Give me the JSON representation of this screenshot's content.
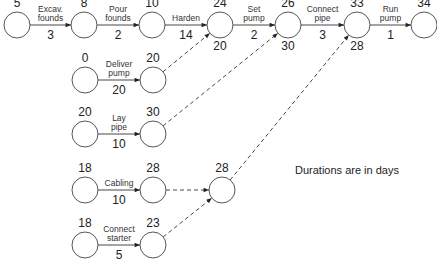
{
  "note": "Durations are in days",
  "nodes": [
    {
      "id": "n1",
      "x": 17,
      "y": 25,
      "top": "5",
      "bottom": ""
    },
    {
      "id": "n2",
      "x": 84,
      "y": 25,
      "top": "8",
      "bottom": ""
    },
    {
      "id": "n3",
      "x": 152,
      "y": 25,
      "top": "10",
      "bottom": ""
    },
    {
      "id": "n4",
      "x": 220,
      "y": 25,
      "top": "24",
      "bottom": "20"
    },
    {
      "id": "n5",
      "x": 288,
      "y": 25,
      "top": "26",
      "bottom": "30"
    },
    {
      "id": "n6",
      "x": 357,
      "y": 25,
      "top": "33",
      "bottom": "28"
    },
    {
      "id": "n7",
      "x": 424,
      "y": 25,
      "top": "34",
      "bottom": ""
    },
    {
      "id": "n8",
      "x": 85,
      "y": 80,
      "top": "0",
      "bottom": ""
    },
    {
      "id": "n9",
      "x": 153,
      "y": 80,
      "top": "20",
      "bottom": ""
    },
    {
      "id": "n10",
      "x": 85,
      "y": 134,
      "top": "20",
      "bottom": ""
    },
    {
      "id": "n11",
      "x": 153,
      "y": 134,
      "top": "30",
      "bottom": ""
    },
    {
      "id": "n12",
      "x": 85,
      "y": 190,
      "top": "18",
      "bottom": ""
    },
    {
      "id": "n13",
      "x": 153,
      "y": 190,
      "top": "28",
      "bottom": ""
    },
    {
      "id": "n14",
      "x": 222,
      "y": 190,
      "top": "28",
      "bottom": ""
    },
    {
      "id": "n15",
      "x": 85,
      "y": 245,
      "top": "18",
      "bottom": ""
    },
    {
      "id": "n16",
      "x": 153,
      "y": 245,
      "top": "23",
      "bottom": ""
    }
  ],
  "activities": [
    {
      "from": "n1",
      "to": "n2",
      "label": [
        "Excav.",
        "founds"
      ],
      "duration": "3"
    },
    {
      "from": "n2",
      "to": "n3",
      "label": [
        "Pour",
        "founds"
      ],
      "duration": "2"
    },
    {
      "from": "n3",
      "to": "n4",
      "label": [
        "Harden"
      ],
      "duration": "14"
    },
    {
      "from": "n4",
      "to": "n5",
      "label": [
        "Set",
        "pump"
      ],
      "duration": "2"
    },
    {
      "from": "n5",
      "to": "n6",
      "label": [
        "Connect",
        "pipe"
      ],
      "duration": "3"
    },
    {
      "from": "n6",
      "to": "n7",
      "label": [
        "Run",
        "pump"
      ],
      "duration": "1"
    },
    {
      "from": "n8",
      "to": "n9",
      "label": [
        "Deliver",
        "pump"
      ],
      "duration": "20"
    },
    {
      "from": "n10",
      "to": "n11",
      "label": [
        "Lay",
        "pipe"
      ],
      "duration": "10"
    },
    {
      "from": "n12",
      "to": "n13",
      "label": [
        "Cabling"
      ],
      "duration": "10"
    },
    {
      "from": "n15",
      "to": "n16",
      "label": [
        "Connect",
        "starter"
      ],
      "duration": "5"
    }
  ],
  "dummies": [
    {
      "from": "n9",
      "to": "n4"
    },
    {
      "from": "n11",
      "to": "n5"
    },
    {
      "from": "n13",
      "to": "n14"
    },
    {
      "from": "n16",
      "to": "n14"
    },
    {
      "from": "n14",
      "to": "n6"
    }
  ]
}
